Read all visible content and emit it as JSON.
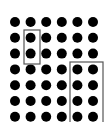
{
  "diagram": {
    "type": "dot-array",
    "rows": 7,
    "columns": 6,
    "dot_color": "#000000",
    "box_color": "#555555",
    "background": "#ffffff",
    "dot_radius": 5,
    "origin_x": 15,
    "origin_y": 22,
    "spacing_x": 15.6,
    "spacing_y": 15.8,
    "groups": [
      {
        "name": "group-vertical-pair",
        "description": "2 dots in column 2, rows 2-3",
        "x": 24,
        "y": 30,
        "width": 16,
        "height": 34
      },
      {
        "name": "group-right-block",
        "description": "columns 5-6, rows 4-7",
        "x": 70,
        "y": 62,
        "width": 33,
        "height": 64
      }
    ]
  }
}
